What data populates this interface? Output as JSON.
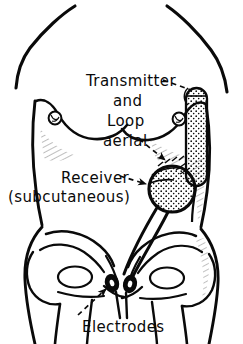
{
  "figure": {
    "ink_color": "#0a0a0a",
    "background_color": "#ffffff",
    "width": 243,
    "height": 344
  },
  "labels": {
    "transmitter": "Transmitter",
    "and": "and",
    "loop": "Loop",
    "aerial": "aerial",
    "receiver": "Receiver",
    "subcutaneous": "(subcutaneous)",
    "electrodes": "Electrodes"
  },
  "parts": [
    {
      "name": "transmitter-loop-aerial",
      "label": "Transmitter and Loop aerial",
      "location": "right lateral chest wall",
      "fill": "stippled"
    },
    {
      "name": "receiver",
      "label": "Receiver (subcutaneous)",
      "location": "right lower abdomen",
      "fill": "stippled"
    },
    {
      "name": "electrode-left",
      "label": "Electrode",
      "location": "pubic region",
      "fill": "solid"
    },
    {
      "name": "electrode-right",
      "label": "Electrode",
      "location": "pubic region",
      "fill": "solid"
    }
  ],
  "leaders": [
    {
      "name": "transmitter-leader",
      "from": "Transmitter",
      "to": "transmitter-loop-aerial",
      "style": "dashed"
    },
    {
      "name": "aerial-leader",
      "from": "aerial",
      "to": "loop-aerial-coil",
      "style": "dashed-arrow"
    },
    {
      "name": "receiver-leader",
      "from": "Receiver",
      "to": "receiver",
      "style": "dashed-arrow"
    },
    {
      "name": "electrodes-leader",
      "from": "Electrodes",
      "to": "electrode-left",
      "style": "dashed-arrow"
    }
  ],
  "anatomy": [
    "neck",
    "shoulders",
    "left breast",
    "right breast",
    "abdomen",
    "iliac crest left",
    "iliac crest right",
    "sacrum",
    "pubic symphysis",
    "hip joint left",
    "hip joint right",
    "thigh left",
    "thigh right"
  ]
}
